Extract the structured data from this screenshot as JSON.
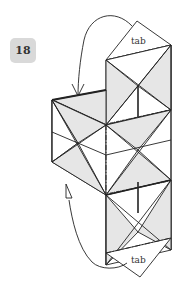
{
  "step": {
    "number": "18"
  },
  "labels": {
    "top_tab": "tab",
    "bottom_tab": "tab"
  },
  "colors": {
    "shade": "#e6e6e6",
    "line": "#222222",
    "badge": "#d9d9d9"
  },
  "arrows": {
    "top": "fold-over arrow from top tab down to left box edge",
    "bottom": "push/hollow arrow from bottom tab up to left box"
  }
}
